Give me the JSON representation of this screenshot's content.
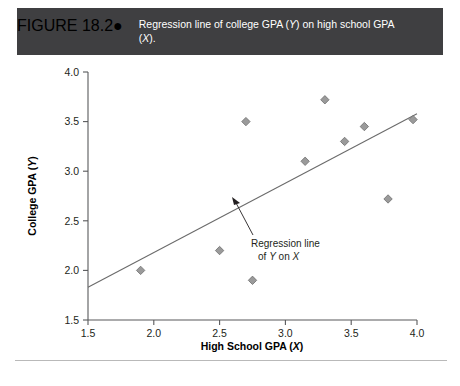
{
  "header": {
    "figure_number": "FIGURE 18.2",
    "bullet": "●",
    "caption_line1": "Regression line of college GPA (Y) on high school",
    "caption_line2": "GPA (X).",
    "background_color": "#3f3f41",
    "text_color": "#ffffff"
  },
  "annotation": {
    "line1": "Regression line",
    "line2_pre": "of ",
    "line2_y": "Y",
    "line2_mid": " on ",
    "line2_x": "X"
  },
  "chart_data": {
    "type": "scatter",
    "title": "Regression line of college GPA (Y) on high school GPA (X).",
    "xlabel": "High School GPA (X)",
    "ylabel": "College GPA (Y)",
    "xlim": [
      1.5,
      4.0
    ],
    "ylim": [
      1.5,
      4.0
    ],
    "xticks": [
      1.5,
      2.0,
      2.5,
      3.0,
      3.5,
      4.0
    ],
    "yticks": [
      1.5,
      2.0,
      2.5,
      3.0,
      3.5,
      4.0
    ],
    "xtick_labels": [
      "1.5",
      "2.0",
      "2.5",
      "3.0",
      "3.5",
      "4.0"
    ],
    "ytick_labels": [
      "1.5",
      "2.0",
      "2.5",
      "3.0",
      "3.5",
      "4.0"
    ],
    "grid": false,
    "legend": false,
    "marker_color": "#9a9a9a",
    "marker_edge_color": "#6e6e6e",
    "marker_shape": "diamond",
    "line_color": "#6b6b6b",
    "axis_color": "#58595b",
    "points": [
      {
        "x": 1.9,
        "y": 2.0
      },
      {
        "x": 2.5,
        "y": 2.2
      },
      {
        "x": 2.7,
        "y": 3.5
      },
      {
        "x": 2.75,
        "y": 1.9
      },
      {
        "x": 3.15,
        "y": 3.1
      },
      {
        "x": 3.3,
        "y": 3.72
      },
      {
        "x": 3.45,
        "y": 3.3
      },
      {
        "x": 3.6,
        "y": 3.45
      },
      {
        "x": 3.78,
        "y": 2.72
      },
      {
        "x": 3.97,
        "y": 3.52
      }
    ],
    "regression_line": {
      "x_start": 1.5,
      "y_start": 1.83,
      "x_end": 4.0,
      "y_end": 3.58,
      "label": "Regression line of Y on X"
    }
  }
}
